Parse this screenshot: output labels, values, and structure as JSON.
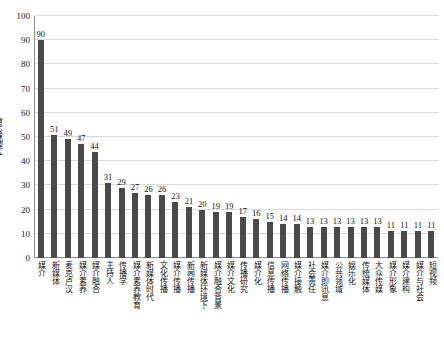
{
  "chart_data": {
    "type": "bar",
    "title": "",
    "xlabel": "",
    "ylabel": "文献数/篇",
    "ylim": [
      0,
      100
    ],
    "ytick_values": [
      0,
      10,
      20,
      30,
      40,
      50,
      60,
      70,
      80,
      90,
      100
    ],
    "ytick_labels": [
      "0",
      "10",
      "20",
      "30",
      "40",
      "50",
      "60",
      "70",
      "80",
      "90",
      "100"
    ],
    "grid": "horizontal",
    "legend": "none",
    "bar_color": "#4a4a4a",
    "categories": [
      "媒介",
      "新媒体",
      "麦克卢汉",
      "媒介素养",
      "媒介融合",
      "主持人",
      "传播学",
      "媒介素养教育",
      "新媒体时代",
      "文化传播",
      "媒介传播",
      "新闻传播",
      "新媒体环境下",
      "媒介融合背景",
      "媒介文化",
      "传播研究",
      "媒介化",
      "信息传播",
      "网络传播",
      "媒介接触",
      "社会责任",
      "媒介即讯息",
      "公共领域",
      "娱乐化",
      "传统媒体",
      "大众传媒",
      "媒介形象",
      "媒介建构",
      "媒介与社会",
      "短视频"
    ],
    "values": [
      90,
      51,
      49,
      47,
      44,
      31,
      29,
      27,
      26,
      26,
      23,
      21,
      20,
      19,
      19,
      17,
      16,
      15,
      14,
      14,
      13,
      13,
      13,
      13,
      13,
      13,
      11,
      11,
      11,
      11
    ]
  }
}
